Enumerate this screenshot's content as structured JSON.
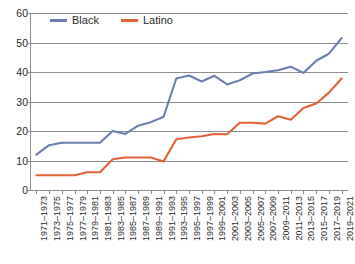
{
  "chart_data": {
    "type": "line",
    "title": "",
    "subtitle": "",
    "xlabel": "",
    "ylabel": "",
    "ylim": [
      0,
      60
    ],
    "ytick_step": 10,
    "yticks": [
      60,
      50,
      40,
      30,
      20,
      10,
      0
    ],
    "grid": true,
    "legend_position": "top-left-inside",
    "categories": [
      "1971–1973",
      "1973–1975",
      "1975–1977",
      "1977–1979",
      "1979–1981",
      "1981–1983",
      "1983–1985",
      "1985–1987",
      "1987–1989",
      "1989–1991",
      "1991–1993",
      "1993–1995",
      "1995–1997",
      "1997–1999",
      "1999–2001",
      "2001–2003",
      "2003–2005",
      "2005–2007",
      "2007–2009",
      "2009–2011",
      "2011–2013",
      "2013–2015",
      "2015–2017",
      "2017–2019",
      "2019–2021"
    ],
    "series": [
      {
        "name": "Black",
        "color": "#6b7fae",
        "values": [
          12.0,
          15.2,
          16.0,
          16.0,
          16.0,
          16.0,
          20.0,
          19.0,
          21.8,
          23.0,
          24.8,
          37.8,
          38.8,
          36.8,
          38.7,
          35.8,
          37.2,
          39.5,
          40.0,
          40.6,
          41.8,
          39.7,
          43.8,
          46.2,
          51.5
        ]
      },
      {
        "name": "Latino",
        "color": "#e2623a",
        "values": [
          5.0,
          5.0,
          5.0,
          5.0,
          6.0,
          6.0,
          10.4,
          11.0,
          11.0,
          11.0,
          9.7,
          17.2,
          17.8,
          18.2,
          19.0,
          18.9,
          22.8,
          22.8,
          22.5,
          25.0,
          23.8,
          27.8,
          29.3,
          33.0,
          37.8
        ]
      }
    ]
  },
  "legend": {
    "items": [
      {
        "label": "Black",
        "color": "#6b7fae"
      },
      {
        "label": "Latino",
        "color": "#e2623a"
      }
    ]
  },
  "colors": {
    "black_series": "#6b7fae",
    "latino_series": "#e2623a",
    "gridline": "#8d8d8d",
    "text": "#2b2b2b",
    "background": "#ffffff"
  }
}
